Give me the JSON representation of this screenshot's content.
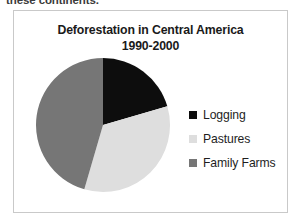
{
  "document": {
    "body_text_fragment": "these continents."
  },
  "figure": {
    "title_line1": "Deforestation in Central America",
    "title_line2": "1990-2000"
  },
  "colors": {
    "logging": "#0d0d0d",
    "pastures": "#dedede",
    "family_farms": "#767676",
    "frame_border": "#c9c9c9",
    "title_text": "#1a1a1a",
    "legend_text": "#1e1e1e",
    "body_text": "#3b3b3b"
  },
  "chart_data": {
    "type": "pie",
    "title": "Deforestation in Central America 1990-2000",
    "labels": [
      "Logging",
      "Pastures",
      "Family Farms"
    ],
    "values": [
      20.5,
      34.0,
      45.5
    ],
    "unit": "percent",
    "start_angle_deg": 0,
    "direction": "clockwise",
    "angles_deg": [
      74,
      123,
      163
    ],
    "colors": [
      "#0d0d0d",
      "#dedede",
      "#767676"
    ],
    "legend_position": "right",
    "grid": false,
    "data_labels": false
  },
  "legend": {
    "items": [
      {
        "label": "Logging",
        "color": "#0d0d0d"
      },
      {
        "label": "Pastures",
        "color": "#dedede"
      },
      {
        "label": "Family Farms",
        "color": "#767676"
      }
    ]
  }
}
